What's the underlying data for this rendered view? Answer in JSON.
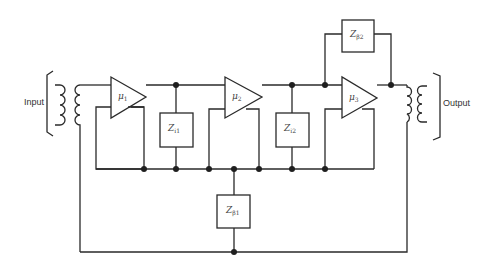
{
  "diagram": {
    "type": "circuit-schematic",
    "labels": {
      "input": "Input",
      "output": "Output"
    },
    "amplifiers": [
      {
        "id": "amp1",
        "symbol": "μ",
        "subscript": "1"
      },
      {
        "id": "amp2",
        "symbol": "μ",
        "subscript": "2"
      },
      {
        "id": "amp3",
        "symbol": "μ",
        "subscript": "3"
      }
    ],
    "impedances": [
      {
        "id": "zi1",
        "symbol": "Z",
        "subscript": "i1",
        "role": "interstage impedance 1"
      },
      {
        "id": "zi2",
        "symbol": "Z",
        "subscript": "i2",
        "role": "interstage impedance 2"
      },
      {
        "id": "zb1",
        "symbol": "Z",
        "subscript": "β1",
        "role": "series feedback impedance"
      },
      {
        "id": "zb2",
        "symbol": "Z",
        "subscript": "β2",
        "role": "shunt feedback impedance"
      }
    ],
    "transformers": [
      {
        "id": "input-transformer",
        "position": "left"
      },
      {
        "id": "output-transformer",
        "position": "right"
      }
    ],
    "colors": {
      "line": "#2a2a2a",
      "node": "#1f1f1f",
      "background": "#ffffff"
    }
  }
}
